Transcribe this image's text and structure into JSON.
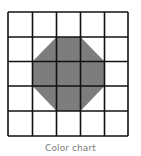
{
  "caption": "Color chart",
  "grid": {
    "rows": 5,
    "cols": 5,
    "x_lines": [
      8,
      32.5,
      56.5,
      80.5,
      104.5,
      128
    ],
    "y_lines": [
      12,
      37,
      61.5,
      86,
      111,
      136
    ],
    "line_color": "#111111",
    "background": "#ffffff"
  },
  "shape": {
    "type": "octagon",
    "fill": "#7d7d7d",
    "points": "56.5,37 80.5,37 104.5,61.5 104.5,86 80.5,111 56.5,111 32.5,86 32.5,61.5"
  }
}
